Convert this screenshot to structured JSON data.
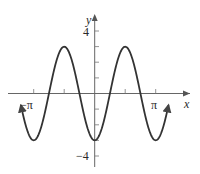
{
  "chart_data": {
    "type": "line",
    "title": "",
    "function": "y = -3cos(2x)",
    "xlabel": "x",
    "ylabel": "y",
    "xlim": [
      -3.8,
      3.8
    ],
    "ylim": [
      -4,
      4
    ],
    "grid": false,
    "legend": null,
    "x_ticks": [
      -3.1416,
      -1.5708,
      1.5708,
      3.1416
    ],
    "x_tick_labels": [
      "−π",
      "",
      "",
      "π"
    ],
    "y_ticks": [
      -4,
      -3,
      -2,
      -1,
      1,
      2,
      3,
      4
    ],
    "y_tick_labels": [
      "−4",
      "",
      "",
      "",
      "",
      "",
      "",
      "4"
    ],
    "series": [
      {
        "name": "y = -3cos(2x)",
        "x": [
          -3.8,
          -3.1416,
          -2.3562,
          -1.5708,
          -0.7854,
          0,
          0.7854,
          1.5708,
          2.3562,
          3.1416,
          3.8
        ],
        "y": [
          -0.75,
          -3,
          0,
          3,
          0,
          -3,
          0,
          3,
          0,
          -3,
          -0.75
        ]
      }
    ],
    "annotations": [
      "arrowheads at both curve ends"
    ]
  },
  "labels": {
    "x_axis": "x",
    "y_axis": "y",
    "y_top": "4",
    "y_bottom": "−4",
    "x_left": "−π",
    "x_right": "π"
  },
  "colors": {
    "curve": "#333333",
    "axes": "#555555"
  }
}
